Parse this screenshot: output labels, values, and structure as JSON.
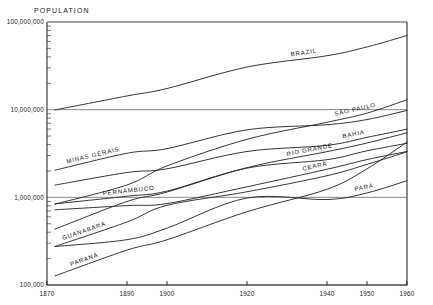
{
  "chart_data": {
    "type": "line",
    "title": "POPULATION",
    "xlabel": "",
    "ylabel": "POPULATION",
    "yscale": "log",
    "ylim": [
      100000,
      100000000
    ],
    "xlim": [
      1870,
      1960
    ],
    "grid": true,
    "legend": "inline-labels",
    "ytick_labels": [
      "100,000,000",
      "10,000,000",
      "1,000,000",
      "100,000"
    ],
    "ytick_values": [
      100000000,
      10000000,
      1000000,
      100000
    ],
    "xtick_labels": [
      "1870",
      "1890",
      "1900",
      "1920",
      "1940",
      "1950",
      "1960"
    ],
    "xtick_values": [
      1870,
      1890,
      1900,
      1920,
      1940,
      1950,
      1960
    ],
    "series": [
      {
        "name": "BRAZIL",
        "label": "BRAZIL",
        "x": [
          1872,
          1890,
          1900,
          1920,
          1940,
          1950,
          1960
        ],
        "values": [
          9930000,
          14333000,
          17438000,
          30635000,
          41236000,
          51944000,
          70119000
        ]
      },
      {
        "name": "MINAS GERAIS",
        "label": "MINAS GERAIS",
        "x": [
          1872,
          1890,
          1900,
          1920,
          1940,
          1950,
          1960
        ],
        "values": [
          2039000,
          3184000,
          3594000,
          5888000,
          6736000,
          7717000,
          9798000
        ]
      },
      {
        "name": "SAO PAULO",
        "label": "SÃO PAULO",
        "x": [
          1872,
          1890,
          1900,
          1920,
          1940,
          1950,
          1960
        ],
        "values": [
          837000,
          1384000,
          2282000,
          4592000,
          7180000,
          9134000,
          12974000
        ]
      },
      {
        "name": "BAHIA",
        "label": "BAHIA",
        "x": [
          1872,
          1890,
          1900,
          1920,
          1940,
          1950,
          1960
        ],
        "values": [
          1379000,
          1919000,
          2117000,
          3334000,
          3918000,
          4834000,
          5990000
        ]
      },
      {
        "name": "RIO GRANDE DO SUL",
        "label": "RIO GRANDE",
        "x": [
          1872,
          1890,
          1900,
          1920,
          1940,
          1950,
          1960
        ],
        "values": [
          434000,
          897000,
          1149000,
          2182000,
          3320000,
          4165000,
          5448000
        ]
      },
      {
        "name": "PERNAMBUCO",
        "label": "PERNAMBUCO",
        "x": [
          1872,
          1890,
          1900,
          1920,
          1940,
          1950,
          1960
        ],
        "values": [
          842000,
          1030000,
          1178000,
          2154000,
          2688000,
          3395000,
          4136000
        ]
      },
      {
        "name": "CEARA",
        "label": "CEARÁ",
        "x": [
          1872,
          1890,
          1900,
          1920,
          1940,
          1950,
          1960
        ],
        "values": [
          721000,
          805000,
          849000,
          1319000,
          2091000,
          2695000,
          3337000
        ]
      },
      {
        "name": "PARA",
        "label": "PARÁ",
        "x": [
          1872,
          1890,
          1900,
          1920,
          1940,
          1950,
          1960
        ],
        "values": [
          275000,
          329000,
          445000,
          983000,
          944000,
          1123000,
          1550000
        ]
      },
      {
        "name": "GUANABARA",
        "label": "GUANABARA",
        "x": [
          1872,
          1890,
          1900,
          1920,
          1940,
          1950,
          1960
        ],
        "values": [
          275000,
          523000,
          811000,
          1158000,
          1764000,
          2377000,
          3307000
        ]
      },
      {
        "name": "PARANA",
        "label": "PARANÁ",
        "x": [
          1872,
          1890,
          1900,
          1920,
          1940,
          1950,
          1960
        ],
        "values": [
          127000,
          250000,
          328000,
          685000,
          1236000,
          2115000,
          4278000
        ]
      }
    ]
  },
  "labels": {
    "title": "POPULATION"
  }
}
